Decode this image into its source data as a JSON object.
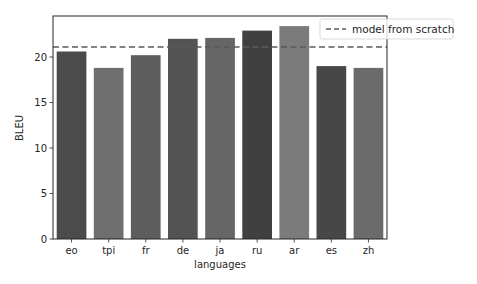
{
  "chart_data": {
    "type": "bar",
    "title": "",
    "xlabel": "languages",
    "ylabel": "BLEU",
    "categories": [
      "eo",
      "tpi",
      "fr",
      "de",
      "ja",
      "ru",
      "ar",
      "es",
      "zh"
    ],
    "values": [
      20.6,
      18.8,
      20.2,
      22.0,
      22.1,
      22.9,
      23.4,
      19.0,
      18.8
    ],
    "colors": [
      "#4b4b4b",
      "#6f6f6f",
      "#5d5d5d",
      "#535353",
      "#666666",
      "#404040",
      "#7b7b7b",
      "#474747",
      "#6b6b6b"
    ],
    "ylim": [
      0,
      25
    ],
    "yticks": [
      0,
      5,
      10,
      15,
      20
    ],
    "grid": false,
    "reference_line": {
      "label": "model from scratch",
      "value": 21.1,
      "style": "dashed",
      "color": "#5a5a5a"
    },
    "legend": {
      "position": "upper right",
      "entries": [
        "model from scratch"
      ]
    }
  }
}
